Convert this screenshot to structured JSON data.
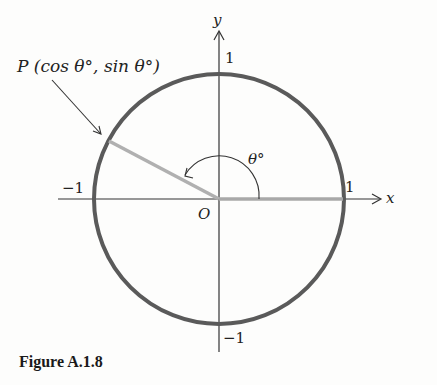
{
  "figure": {
    "caption": "Figure A.1.8",
    "point_label": "P (cos θ°, sin θ°)",
    "angle_label": "θ°",
    "origin_label": "O",
    "x_axis_label": "x",
    "y_axis_label": "y",
    "tick_labels": {
      "x_pos": "1",
      "x_neg": "−1",
      "y_pos": "1",
      "y_neg": "−1"
    },
    "colors": {
      "circle": "#5a5a5a",
      "radius": "#b0b0b0",
      "axes": "#333333"
    }
  }
}
